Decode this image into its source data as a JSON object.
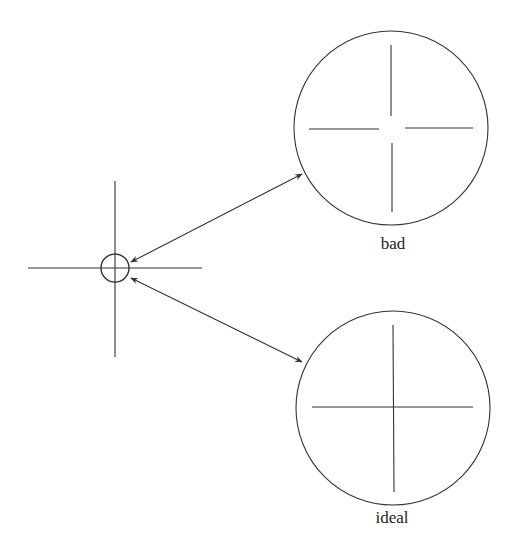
{
  "diagram": {
    "stroke_color": "#333333",
    "background": "#ffffff",
    "target": {
      "center": [
        115,
        268
      ],
      "ring_radius": 14,
      "vertical_line": [
        115,
        181,
        115,
        357
      ],
      "horizontal_line": [
        28,
        268,
        202,
        268
      ]
    },
    "views": [
      {
        "label": "bad",
        "center": [
          391,
          128
        ],
        "radius": 97,
        "crosshair_gap": true,
        "label_pos": [
          392,
          238
        ]
      },
      {
        "label": "ideal",
        "center": [
          393,
          408
        ],
        "radius": 97,
        "crosshair_gap": false,
        "label_pos": [
          392,
          512
        ]
      }
    ],
    "arrows": [
      {
        "from": [
          302,
          174
        ],
        "to": [
          131,
          262
        ],
        "double_headed": true
      },
      {
        "from": [
          302,
          362
        ],
        "to": [
          131,
          278
        ],
        "double_headed": true
      }
    ]
  }
}
